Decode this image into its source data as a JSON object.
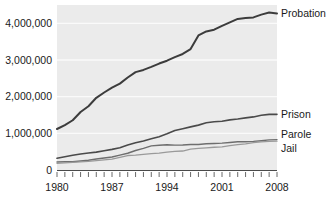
{
  "chart_data": {
    "type": "line",
    "title": "",
    "xlabel": "",
    "ylabel": "",
    "xlim": [
      1980,
      2008
    ],
    "ylim": [
      0,
      4500000
    ],
    "grid": true,
    "legend_position": "right-inline",
    "x": [
      1980,
      1981,
      1982,
      1983,
      1984,
      1985,
      1986,
      1987,
      1988,
      1989,
      1990,
      1991,
      1992,
      1993,
      1994,
      1995,
      1996,
      1997,
      1998,
      1999,
      2000,
      2001,
      2002,
      2003,
      2004,
      2005,
      2006,
      2007,
      2008
    ],
    "xtick_labels": [
      "1980",
      "1987",
      "1994",
      "2001",
      "2008"
    ],
    "xtick_values": [
      1980,
      1987,
      1994,
      2001,
      2008
    ],
    "ytick_labels": [
      "0",
      "1,000,000",
      "2,000,000",
      "3,000,000",
      "4,000,000"
    ],
    "ytick_values": [
      0,
      1000000,
      2000000,
      3000000,
      4000000
    ],
    "series": [
      {
        "name": "Probation",
        "color": "#3c3c3c",
        "width": 2.0,
        "values": [
          1118000,
          1225000,
          1357000,
          1582000,
          1740000,
          1969000,
          2114000,
          2247000,
          2356000,
          2522000,
          2670000,
          2729000,
          2811000,
          2903000,
          2981000,
          3078000,
          3165000,
          3297000,
          3671000,
          3779000,
          3826000,
          3932000,
          4025000,
          4120000,
          4143000,
          4162000,
          4237000,
          4293000,
          4270000
        ]
      },
      {
        "name": "Prison",
        "color": "#4a4a4a",
        "width": 1.6,
        "values": [
          320000,
          360000,
          402000,
          437000,
          462000,
          487000,
          526000,
          562000,
          607000,
          683000,
          743000,
          792000,
          850000,
          909000,
          990000,
          1078000,
          1127000,
          1176000,
          1224000,
          1287000,
          1316000,
          1330000,
          1367000,
          1390000,
          1421000,
          1448000,
          1492000,
          1517000,
          1518000
        ]
      },
      {
        "name": "Parole",
        "color": "#6e6e6e",
        "width": 1.4,
        "values": [
          220000,
          226000,
          224000,
          246000,
          266000,
          300000,
          327000,
          355000,
          407000,
          456000,
          531000,
          590000,
          658000,
          676000,
          690000,
          679000,
          680000,
          694000,
          696000,
          714000,
          724000,
          732000,
          750000,
          769000,
          771000,
          780000,
          799000,
          821000,
          828000
        ]
      },
      {
        "name": "Jail",
        "color": "#9a9a9a",
        "width": 1.3,
        "values": [
          182000,
          196000,
          209000,
          223000,
          234000,
          256000,
          274000,
          295000,
          343000,
          395000,
          405000,
          426000,
          444000,
          459000,
          486000,
          507000,
          518000,
          567000,
          592000,
          605000,
          621000,
          631000,
          665000,
          691000,
          713000,
          747000,
          766000,
          780000,
          785000
        ]
      }
    ]
  }
}
